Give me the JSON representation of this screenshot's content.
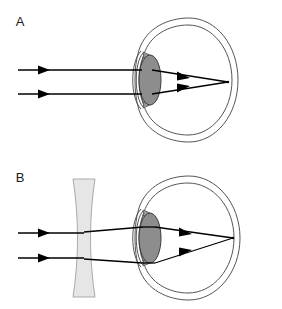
{
  "figure": {
    "background_color": "#ffffff",
    "width": 282,
    "height": 309,
    "panels": [
      {
        "id": "A",
        "label": "A",
        "label_x": 20,
        "label_y": 26,
        "caption": "Uncorrected myopic eye: parallel light rays converge to a focal point in front of the retina",
        "has_corrective_lens": false,
        "focal_point": {
          "x": 228,
          "y": 82,
          "on_retina": false
        },
        "incoming_rays": [
          {
            "x_start": 18,
            "x_end": 140,
            "y": 70,
            "arrow_x": 47
          },
          {
            "x_start": 18,
            "x_end": 140,
            "y": 94,
            "arrow_x": 47
          }
        ],
        "internal_rays": [
          {
            "from_x": 158,
            "from_y": 70,
            "to_x": 228,
            "to_y": 82,
            "arrow_x": 188
          },
          {
            "from_x": 158,
            "from_y": 94,
            "to_x": 228,
            "to_y": 82,
            "arrow_x": 188
          }
        ],
        "eye": {
          "center_x": 185,
          "center_y": 80,
          "globe_left": 132,
          "globe_right": 238,
          "globe_top": 18,
          "globe_bottom": 142,
          "crystalline_lens": {
            "cx": 150,
            "cy": 80,
            "rx": 11,
            "ry": 25
          },
          "lens_fill": "#8d8d8d",
          "outline_color": "#555555"
        }
      },
      {
        "id": "B",
        "label": "B",
        "label_x": 20,
        "label_y": 182,
        "caption": "Myopic eye corrected by a biconcave diverging spectacle lens: rays now focus on the retina",
        "has_corrective_lens": true,
        "focal_point": {
          "x": 233,
          "y": 238,
          "on_retina": true
        },
        "incoming_rays": [
          {
            "x_start": 18,
            "x_end": 78,
            "y": 233,
            "arrow_x": 47
          },
          {
            "x_start": 18,
            "x_end": 78,
            "y": 258,
            "arrow_x": 47
          }
        ],
        "internal_rays": [
          {
            "from_x": 158,
            "from_y": 228,
            "to_x": 233,
            "to_y": 238,
            "arrow_x": 190
          },
          {
            "from_x": 158,
            "from_y": 260,
            "to_x": 233,
            "to_y": 238,
            "arrow_x": 190
          }
        ],
        "corrective_lens": {
          "type": "biconcave",
          "left": 72,
          "right": 96,
          "top": 178,
          "bottom": 298,
          "fill": "#e6e6e6",
          "stroke": "#b0b0b0"
        },
        "eye": {
          "center_x": 185,
          "center_y": 238,
          "globe_left": 132,
          "globe_right": 240,
          "globe_top": 176,
          "globe_bottom": 300,
          "crystalline_lens": {
            "cx": 150,
            "cy": 238,
            "rx": 11,
            "ry": 25
          },
          "lens_fill": "#8d8d8d",
          "outline_color": "#555555"
        }
      }
    ],
    "colors": {
      "ray": "#000000",
      "eye_outline": "#555555",
      "crystalline_lens_fill": "#8d8d8d",
      "corrective_lens_fill": "#e6e6e6",
      "corrective_lens_stroke": "#aaaaaa",
      "label_text": "#1a1a1a",
      "background": "#ffffff"
    }
  }
}
